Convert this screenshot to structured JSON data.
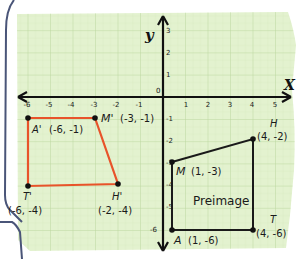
{
  "axes": {
    "x_label": "X",
    "y_label": "y",
    "origin_label": "0",
    "x_ticks": [
      "-6",
      "-5",
      "-4",
      "-3",
      "-2",
      "-1",
      "1",
      "2",
      "3",
      "4",
      "5"
    ],
    "y_ticks_pos": [
      "3",
      "2",
      "1"
    ],
    "y_ticks_neg": [
      "-1",
      "-2",
      "-3",
      "-4",
      "-5",
      "-6"
    ]
  },
  "image": {
    "color": "#e8532a",
    "vertices": [
      {
        "name": "A'",
        "coord": "(-6, -1)",
        "x": -6,
        "y": -1
      },
      {
        "name": "M'",
        "coord": "(-3, -1)",
        "x": -3,
        "y": -1
      },
      {
        "name": "H'",
        "coord": "(-2, -4)",
        "x": -2,
        "y": -4
      },
      {
        "name": "T'",
        "coord": "(-6, -4)",
        "x": -6,
        "y": -4
      }
    ]
  },
  "preimage": {
    "label": "Preimage",
    "color": "#1a1a1a",
    "vertices": [
      {
        "name": "M",
        "coord": "(1, -3)",
        "x": 1,
        "y": -3
      },
      {
        "name": "H",
        "coord": "(4, -2)",
        "x": 4,
        "y": -2
      },
      {
        "name": "T",
        "coord": "(4, -6)",
        "x": 4,
        "y": -6
      },
      {
        "name": "A",
        "coord": "(1, -6)",
        "x": 1,
        "y": -6
      }
    ]
  },
  "colors": {
    "paper": "#e3f2cf",
    "grid_minor": "#cfe4b6",
    "grid_major": "#b9d69c",
    "border": "#4a5578"
  }
}
